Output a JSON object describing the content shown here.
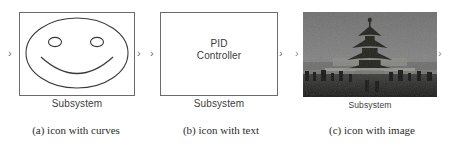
{
  "figure": {
    "panels": [
      {
        "id": "a",
        "caption": "(a) icon with curves",
        "block_label": "Subsystem",
        "icon_kind": "curves",
        "icon_name": "smiley-face-icon",
        "ports": {
          "input": "›",
          "output": "›"
        },
        "border_color": "#6b6b6b",
        "line_color": "#3a3a3a"
      },
      {
        "id": "b",
        "caption": "(b) icon with text",
        "block_label": "Subsystem",
        "icon_kind": "text",
        "icon_text_line1": "PID",
        "icon_text_line2": "Controller",
        "ports": {
          "input": "›",
          "output": "›"
        },
        "border_color": "#6b6b6b",
        "text_color": "#3a3a3a"
      },
      {
        "id": "c",
        "caption": "(c) icon with image",
        "block_label": "Subsystem",
        "icon_kind": "image",
        "icon_name": "temple-of-heaven-pagoda-photo",
        "ports": {
          "input": "›",
          "output": "›"
        },
        "photo_sky_color": "#7a7a7a",
        "photo_pagoda_color": "#20201e",
        "photo_ground_color": "#2a2a28",
        "label_color": "#3d3d3d"
      }
    ]
  }
}
